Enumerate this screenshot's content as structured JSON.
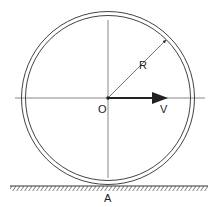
{
  "diagram": {
    "labels": {
      "center": "O",
      "radius": "R",
      "velocity": "V",
      "contact_point": "A"
    },
    "colors": {
      "stroke": "#333333",
      "background": "#ffffff"
    }
  }
}
